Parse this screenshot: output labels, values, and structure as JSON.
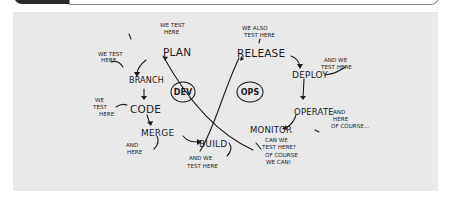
{
  "diagram": {
    "background_color": "#e9e9e9",
    "ink_color": "#1c1c1c",
    "centers": {
      "dev": "DEV",
      "ops": "OPS"
    },
    "nodes": {
      "plan": "PLAN",
      "branch": "BRANCH",
      "code": "CODE",
      "merge": "MERGE",
      "build": "BUILD",
      "release": "RELEASE",
      "deploy": "DEPLOY",
      "operate": "OPERATE",
      "monitor": "MONITOR"
    },
    "annotations": {
      "plan_1": "WE TEST",
      "plan_2": "HERE",
      "branch_1": "WE TEST",
      "branch_2": "HERE",
      "code_1": "WE",
      "code_2": "TEST",
      "code_3": "HERE",
      "merge_1": "AND",
      "merge_2": "HERE",
      "build_1": "AND WE",
      "build_2": "TEST HERE",
      "release_1": "WE ALSO",
      "release_2": "TEST HERE",
      "deploy_1": "AND WE",
      "deploy_2": "TEST HERE",
      "operate_1": "AND",
      "operate_2": "HERE",
      "operate_3": "OF COURSE...",
      "monitor_1": "CAN WE",
      "monitor_2": "TEST HERE?",
      "monitor_3": "OF COURSE",
      "monitor_4": "WE CAN!"
    }
  }
}
